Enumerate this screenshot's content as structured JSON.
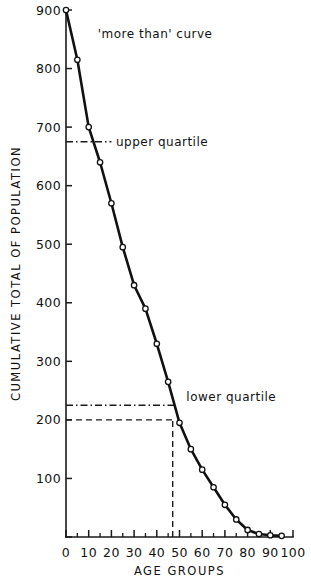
{
  "chart_data": {
    "type": "line",
    "title": "",
    "xlabel": "AGE GROUPS",
    "ylabel": "CUMULATIVE TOTAL OF POPULATION",
    "xlim": [
      0,
      100
    ],
    "ylim": [
      0,
      900
    ],
    "grid": false,
    "legend": "none",
    "x_ticks_major": [
      0,
      10,
      20,
      30,
      40,
      50,
      60,
      70,
      80,
      90,
      100
    ],
    "x_ticks_minor": [
      5,
      15,
      25,
      35,
      45,
      55,
      65,
      75,
      85,
      95
    ],
    "y_ticks_major": [
      0,
      100,
      200,
      300,
      400,
      500,
      600,
      700,
      800,
      900
    ],
    "x_tick_labels": [
      "0",
      "10",
      "20",
      "30",
      "40",
      "50",
      "60",
      "70",
      "80",
      "90",
      "100"
    ],
    "y_tick_labels": [
      "",
      "100",
      "200",
      "300",
      "400",
      "500",
      "600",
      "700",
      "800",
      "900"
    ],
    "series": [
      {
        "name": "'more than' curve",
        "marker": "open-circle",
        "x": [
          0,
          5,
          10,
          15,
          20,
          25,
          30,
          35,
          40,
          45,
          50,
          55,
          60,
          65,
          70,
          75,
          80,
          85,
          90,
          95
        ],
        "values": [
          900,
          815,
          700,
          640,
          570,
          495,
          430,
          390,
          330,
          265,
          195,
          150,
          115,
          85,
          55,
          30,
          12,
          5,
          3,
          2
        ]
      }
    ],
    "annotations": [
      {
        "name": "curve-label",
        "text": "'more than' curve",
        "x": 14,
        "y": 852
      },
      {
        "name": "upper-quartile-label",
        "text": "upper quartile",
        "x": 22,
        "y": 668
      },
      {
        "name": "lower-quartile-label",
        "text": "lower quartile",
        "x": 53,
        "y": 232
      }
    ],
    "reference_lines": [
      {
        "name": "upper-quartile-line",
        "style": "dash-dot",
        "orientation": "horizontal",
        "y": 675,
        "x_start": 0,
        "x_end": 20
      },
      {
        "name": "lower-quartile-line",
        "style": "dash-dot",
        "orientation": "horizontal",
        "y": 225,
        "x_start": 0,
        "x_end": 49
      },
      {
        "name": "median-guide-horizontal",
        "style": "dashed",
        "orientation": "horizontal",
        "y": 200,
        "x_start": 0,
        "x_end": 47
      },
      {
        "name": "median-guide-vertical",
        "style": "dashed",
        "orientation": "vertical",
        "x": 47,
        "y_start": 0,
        "y_end": 200
      }
    ]
  }
}
